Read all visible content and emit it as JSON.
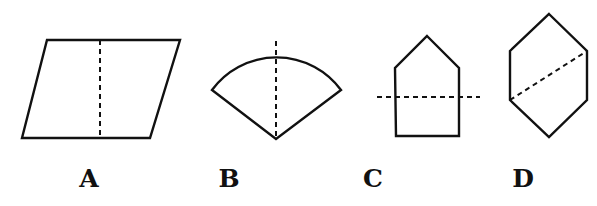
{
  "figure": {
    "options": [
      {
        "id": "A",
        "label": "A",
        "shape": "parallelogram",
        "fold_line": "vertical dashed line through the middle",
        "points": [
          [
            47,
            40
          ],
          [
            180,
            40
          ],
          [
            150,
            138
          ],
          [
            22,
            138
          ]
        ],
        "fold": [
          [
            100,
            40
          ],
          [
            100,
            137
          ]
        ],
        "label_x": 69
      },
      {
        "id": "B",
        "label": "B",
        "shape": "circular sector (fan)",
        "fold_line": "vertical dashed line from arc top to apex",
        "fold": [
          [
            276,
            41
          ],
          [
            276,
            139
          ]
        ],
        "label_x": 209
      },
      {
        "id": "C",
        "label": "C",
        "shape": "pentagon (house shape)",
        "fold_line": "horizontal dashed line across the lower part",
        "points": [
          [
            427,
            36
          ],
          [
            459,
            68
          ],
          [
            459,
            136
          ],
          [
            396,
            136
          ],
          [
            395,
            68
          ]
        ],
        "fold": [
          [
            377,
            97
          ],
          [
            480,
            97
          ]
        ],
        "label_x": 353
      },
      {
        "id": "D",
        "label": "D",
        "shape": "hexagon",
        "fold_line": "diagonal dashed line between opposite vertices",
        "points": [
          [
            549,
            14
          ],
          [
            587,
            51
          ],
          [
            587,
            100
          ],
          [
            549,
            137
          ],
          [
            510,
            100
          ],
          [
            510,
            51
          ]
        ],
        "fold": [
          [
            510,
            100
          ],
          [
            587,
            51
          ]
        ],
        "label_x": 503
      }
    ],
    "colors": {
      "stroke": "#111111",
      "background": "#ffffff"
    }
  }
}
